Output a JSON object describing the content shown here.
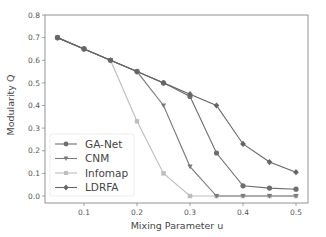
{
  "chart_data": {
    "type": "line",
    "title": "",
    "xlabel": "Mixing Parameter u",
    "ylabel": "Modularity Q",
    "xlim": [
      0.03,
      0.52
    ],
    "ylim": [
      -0.03,
      0.8
    ],
    "xticks": [
      0.1,
      0.2,
      0.3,
      0.4,
      0.5
    ],
    "yticks": [
      0.0,
      0.1,
      0.2,
      0.3,
      0.4,
      0.5,
      0.6,
      0.7,
      0.8
    ],
    "xtick_labels": [
      "0.1",
      "0.2",
      "0.3",
      "0.4",
      "0.5"
    ],
    "ytick_labels": [
      "0.0",
      "0.1",
      "0.2",
      "0.3",
      "0.4",
      "0.5",
      "0.6",
      "0.7",
      "0.8"
    ],
    "grid": false,
    "legend_position": "lower left",
    "x": [
      0.05,
      0.1,
      0.15,
      0.2,
      0.25,
      0.3,
      0.35,
      0.4,
      0.45,
      0.5
    ],
    "series": [
      {
        "name": "GA-Net",
        "marker": "circle",
        "color": "#6e6e6e",
        "values": [
          0.7,
          0.65,
          0.6,
          0.55,
          0.5,
          0.44,
          0.19,
          0.045,
          0.035,
          0.03
        ]
      },
      {
        "name": "CNM",
        "marker": "triangle-down",
        "color": "#7a7a7a",
        "values": [
          0.7,
          0.65,
          0.6,
          0.55,
          0.4,
          0.13,
          0.0,
          0.0,
          0.0,
          0.0
        ]
      },
      {
        "name": "Infomap",
        "marker": "square",
        "color": "#bdbdbd",
        "values": [
          0.7,
          0.65,
          0.6,
          0.33,
          0.1,
          0.0,
          0.0,
          0.0,
          0.0,
          0.0
        ]
      },
      {
        "name": "LDRFA",
        "marker": "diamond",
        "color": "#666666",
        "values": [
          0.7,
          0.65,
          0.6,
          0.55,
          0.5,
          0.45,
          0.4,
          0.23,
          0.15,
          0.105
        ]
      }
    ]
  }
}
